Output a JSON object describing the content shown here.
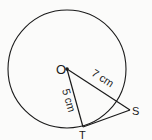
{
  "diagram": {
    "type": "circle-tangent",
    "points": {
      "O": {
        "label": "O",
        "x": 67,
        "y": 69
      },
      "T": {
        "label": "T",
        "x": 83,
        "y": 127
      },
      "S": {
        "label": "S",
        "x": 130,
        "y": 110
      }
    },
    "circle": {
      "center": "O",
      "radius_px": 59
    },
    "segments": [
      {
        "from": "O",
        "to": "T",
        "label": "5 cm"
      },
      {
        "from": "O",
        "to": "S",
        "label": "7 cm"
      },
      {
        "from": "T",
        "to": "S",
        "label": ""
      }
    ],
    "colors": {
      "stroke": "#1a1a1a",
      "background": "#fbfbfa"
    }
  }
}
